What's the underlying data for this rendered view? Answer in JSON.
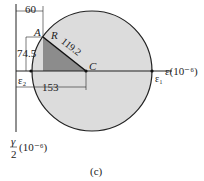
{
  "figure": {
    "caption": "(c)",
    "points": {
      "A": "A",
      "R": "R",
      "C": "C"
    },
    "dims": {
      "top": "60",
      "left": "74.5",
      "radius": "119.2",
      "bottom": "153"
    },
    "axes": {
      "x_label": "ε(10⁻⁶)",
      "y_label_num": "γ",
      "y_label_den": "2",
      "y_label_unit": "(10⁻⁶)"
    },
    "markers": {
      "e1": "ε₁",
      "e2": "ε₂"
    },
    "colors": {
      "circle_fill": "#dcdcdc",
      "triangle_fill": "#8c8c8c",
      "line": "#222222"
    }
  }
}
